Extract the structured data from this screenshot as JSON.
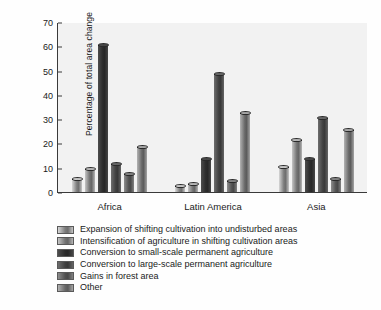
{
  "chart_data": {
    "type": "bar",
    "title": "",
    "xlabel": "",
    "ylabel": "Percentage of total area change",
    "ylim": [
      0,
      70
    ],
    "yticks": [
      0,
      10,
      20,
      30,
      40,
      50,
      60,
      70
    ],
    "grid": false,
    "legend_position": "below",
    "categories": [
      "Africa",
      "Latin America",
      "Asia"
    ],
    "series": [
      {
        "name": "Expansion of shifting cultivation into undisturbed areas",
        "color": "#a8a8a8",
        "values": [
          5,
          2,
          10
        ]
      },
      {
        "name": "Intensification of agriculture in shifting cultivation areas",
        "color": "#9a9a9a",
        "values": [
          9,
          3,
          21
        ]
      },
      {
        "name": "Conversion to small-scale permanent agriculture",
        "color": "#3c3c3c",
        "values": [
          60,
          13,
          13
        ]
      },
      {
        "name": "Conversion to large-scale permanent agriculture",
        "color": "#565656",
        "values": [
          11,
          48,
          30
        ]
      },
      {
        "name": "Gains in forest area",
        "color": "#6e6e6e",
        "values": [
          7,
          4,
          5
        ]
      },
      {
        "name": "Other",
        "color": "#8c8c8c",
        "values": [
          18,
          32,
          25
        ]
      }
    ]
  }
}
